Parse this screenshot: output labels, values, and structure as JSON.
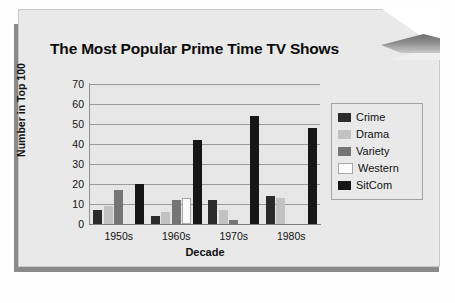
{
  "chart_data": {
    "type": "bar",
    "title": "The Most Popular Prime Time TV Shows",
    "xlabel": "Decade",
    "ylabel": "Number in Top 100",
    "categories": [
      "1950s",
      "1960s",
      "1970s",
      "1980s"
    ],
    "ylim": [
      0,
      70
    ],
    "yticks": [
      0,
      10,
      20,
      30,
      40,
      50,
      60,
      70
    ],
    "grid": true,
    "legend_position": "right",
    "series": [
      {
        "name": "Crime",
        "color": "#2b2b2b",
        "values": [
          7,
          4,
          12,
          14
        ]
      },
      {
        "name": "Drama",
        "color": "#c2c2c2",
        "values": [
          9,
          6,
          7,
          13
        ]
      },
      {
        "name": "Variety",
        "color": "#757575",
        "values": [
          17,
          12,
          2,
          0
        ]
      },
      {
        "name": "Western",
        "color": "#fbfbfb",
        "values": [
          0,
          13,
          0,
          0
        ]
      },
      {
        "name": "SitCom",
        "color": "#161616",
        "values": [
          20,
          42,
          54,
          48
        ]
      }
    ]
  },
  "page": {
    "background_color": "#e9e9e9",
    "shadow_color": "#8a8a8a",
    "corner_fold": "page-curl-top-right"
  }
}
